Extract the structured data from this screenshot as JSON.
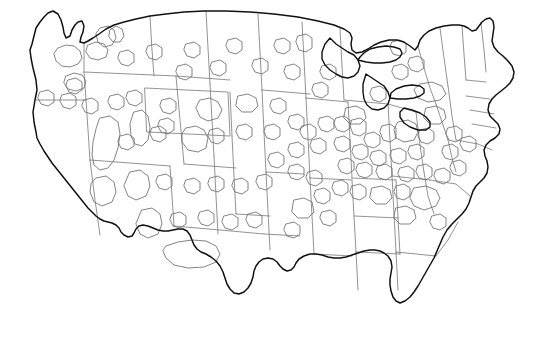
{
  "document": {
    "title": "Contiguous United States Outline Map",
    "type": "map",
    "caption": "",
    "background_color": "#ffffff",
    "width": 544,
    "height": 350
  },
  "map": {
    "name": "contiguous-united-states",
    "projection_hint": "albers-usa",
    "has_labels": false,
    "has_legend": false,
    "has_text": false,
    "colors": {
      "national_outline": "#111111",
      "state_border": "#777777",
      "region_overlay": "#6e6e6e",
      "lake_outline": "#111111",
      "land_fill": "#ffffff",
      "page_background": "#ffffff"
    },
    "line_weights": {
      "national_outline": 1.5,
      "state_border": 0.8,
      "region_overlay": 0.85,
      "lake_outline": 1.4
    },
    "layers": [
      {
        "id": "national-outline",
        "label": "National coastline and borders",
        "stroke": "#111111",
        "visible": true
      },
      {
        "id": "state-borders",
        "label": "State boundaries",
        "stroke": "#777777",
        "visible": true
      },
      {
        "id": "great-lakes",
        "label": "Great Lakes shoreline",
        "stroke": "#111111",
        "visible": true
      },
      {
        "id": "region-overlays",
        "label": "Region overlay polygons",
        "stroke": "#6e6e6e",
        "visible": true,
        "count": 96
      }
    ],
    "outline_path": "M 36 132 L 34 122 L 33 112 L 35 100 L 37 90 L 36 80 L 33 68 L 31 58 L 30 50 L 32 44 L 34 36 L 36 28 L 40 22 L 44 17 L 48 13 L 53 11 L 58 14 L 61 20 L 63 27 L 64 33 L 66 38 L 70 36 L 72 30 L 75 25 L 78 22 L 82 21 L 84 26 L 83 32 L 81 37 L 80 42 L 84 43 L 88 41 L 93 38 L 99 34 L 106 29 L 114 25 L 124 22 L 136 19 L 150 16 L 166 14 L 184 12 L 204 11 L 226 11 L 250 12 L 274 14 L 298 17 L 318 21 L 334 25 L 344 29 L 350 33 L 352 38 L 351 44 L 352 50 L 356 53 L 362 52 L 368 49 L 374 45 L 381 42 L 389 40 L 397 40 L 404 42 L 410 46 L 415 50 L 418 46 L 420 40 L 424 35 L 429 31 L 436 28 L 444 26 L 452 25 L 459 25 L 464 26 L 468 28 L 472 31 L 476 30 L 479 26 L 482 22 L 486 19 L 490 18 L 493 21 L 494 27 L 493 34 L 492 41 L 494 47 L 498 52 L 503 56 L 508 61 L 512 66 L 514 72 L 513 78 L 510 83 L 506 87 L 501 91 L 496 95 L 492 99 L 489 104 L 488 110 L 490 116 L 494 120 L 498 124 L 500 129 L 499 134 L 495 138 L 490 141 L 486 145 L 484 150 L 485 156 L 487 161 L 488 167 L 487 173 L 484 178 L 480 182 L 476 186 L 473 191 L 471 197 L 469 203 L 466 209 L 462 214 L 457 219 L 452 224 L 447 230 L 443 237 L 440 244 L 437 251 L 434 258 L 430 265 L 426 272 L 422 279 L 418 286 L 414 292 L 410 297 L 405 301 L 400 303 L 396 301 L 393 297 L 391 291 L 390 285 L 390 279 L 391 273 L 392 267 L 391 261 L 388 256 L 384 253 L 380 251 L 375 250 L 370 250 L 364 251 L 358 253 L 352 255 L 346 257 L 340 258 L 334 258 L 328 257 L 322 255 L 316 254 L 310 254 L 304 256 L 299 259 L 296 263 L 294 267 L 291 270 L 287 271 L 283 269 L 280 266 L 277 262 L 273 259 L 268 258 L 263 259 L 259 262 L 256 266 L 254 271 L 253 277 L 251 283 L 248 288 L 244 292 L 239 294 L 234 293 L 230 289 L 227 284 L 225 278 L 223 272 L 220 266 L 216 261 L 211 257 L 206 254 L 201 252 L 197 249 L 194 245 L 192 240 L 190 235 L 187 231 L 183 229 L 178 229 L 173 230 L 168 231 L 163 231 L 158 230 L 153 228 L 148 226 L 143 225 L 139 226 L 136 229 L 134 233 L 132 236 L 128 237 L 124 235 L 121 232 L 119 228 L 116 225 L 112 223 L 108 222 L 104 221 L 100 219 L 96 216 L 92 212 L 88 208 L 84 203 L 80 198 L 76 193 L 72 188 L 68 183 L 64 178 L 60 173 L 56 168 L 52 163 L 48 157 L 44 151 L 40 144 L 37 138 Z",
    "state_border_paths": [
      "M 84 43 L 84 72 L 86 100",
      "M 36 100 L 70 100 L 86 100",
      "M 86 100 L 88 130 L 90 160",
      "M 90 160 L 130 163 L 170 166",
      "M 170 166 L 172 196 L 174 226",
      "M 90 160 L 95 200 L 100 235",
      "M 84 72 L 130 74 L 176 76",
      "M 176 76 L 180 120 L 184 164",
      "M 150 16 L 152 50 L 154 76",
      "M 206 11 L 208 48 L 210 84",
      "M 210 84 L 212 120 L 214 156",
      "M 214 156 L 216 196 L 218 234",
      "M 145 88 L 228 92 L 230 136 L 147 132 Z",
      "M 230 92 L 232 136",
      "M 232 136 L 234 176 L 236 214",
      "M 176 76 L 230 80",
      "M 184 164 L 236 168",
      "M 174 226 L 220 230 L 264 234",
      "M 258 14 L 260 52 L 262 90",
      "M 262 90 L 264 132 L 266 172",
      "M 266 172 L 268 212 L 270 250",
      "M 236 214 L 270 216",
      "M 262 90 L 310 94",
      "M 266 172 L 304 174",
      "M 264 234 L 300 236",
      "M 302 22 L 304 60 L 306 98",
      "M 306 98 L 308 138 L 310 178",
      "M 310 178 L 312 216 L 314 254",
      "M 306 98 L 348 102",
      "M 310 178 L 352 180",
      "M 314 254 L 352 256",
      "M 340 29 L 342 66 L 344 100",
      "M 348 102 L 350 140 L 352 178",
      "M 352 180 L 354 216 L 356 252",
      "M 356 252 L 358 290",
      "M 352 178 L 396 180",
      "M 354 216 L 398 218",
      "M 356 252 L 400 254",
      "M 344 100 L 388 104 L 416 112",
      "M 388 104 L 390 140 L 392 176",
      "M 392 176 L 394 214 L 396 252",
      "M 396 252 L 398 290",
      "M 416 112 L 420 145 L 424 172",
      "M 424 172 L 428 196 L 434 214",
      "M 392 176 L 430 180",
      "M 396 252 L 436 256",
      "M 396 180 L 398 218 L 400 254",
      "M 418 46 L 424 68 L 430 88 L 436 104",
      "M 436 104 L 442 122 L 448 140",
      "M 448 140 L 452 158 L 456 172",
      "M 430 180 L 456 184 L 470 196",
      "M 436 256 L 448 240 L 458 222",
      "M 440 28 L 444 58 L 448 86",
      "M 448 86 L 452 116 L 456 140",
      "M 462 26 L 464 54 L 466 80",
      "M 481 23 L 484 50 L 486 72",
      "M 466 80 L 486 82",
      "M 466 96 L 490 99",
      "M 470 110 L 494 114",
      "M 456 140 L 478 144 L 492 150",
      "M 472 124 L 496 128"
    ],
    "great_lakes_paths": [
      "M 330 38 L 336 44 L 342 48 L 348 52 L 354 55 L 358 60 L 360 66 L 358 72 L 354 76 L 348 78 L 342 77 L 336 74 L 330 70 L 325 65 L 322 59 L 322 52 L 325 44 Z",
      "M 358 60 L 366 62 L 374 63 L 382 63 L 390 62 L 396 60 L 400 57 L 402 53 L 400 49 L 394 47 L 386 46 L 378 47 L 370 49 L 364 53 L 360 57 Z",
      "M 366 74 L 372 78 L 378 82 L 384 86 L 388 92 L 390 98 L 388 104 L 384 108 L 378 110 L 372 109 L 367 105 L 364 99 L 363 92 L 363 84 Z",
      "M 390 98 L 398 99 L 406 99 L 414 98 L 420 96 L 424 93 L 424 89 L 420 86 L 412 85 L 404 86 L 396 89 L 391 93 Z",
      "M 404 108 L 412 110 L 420 113 L 426 117 L 430 122 L 430 127 L 426 130 L 418 130 L 410 127 L 404 123 L 400 117 L 400 112 Z"
    ],
    "region_overlay_paths": [
      "M 58 48 L 66 45 L 74 46 L 80 51 L 82 58 L 78 64 L 70 67 L 62 66 L 56 61 L 54 54 Z",
      "M 88 45 L 96 42 L 104 44 L 108 50 L 106 57 L 98 60 L 90 58 L 86 52 Z",
      "M 100 28 L 108 26 L 114 30 L 116 38 L 112 45 L 104 47 L 98 42 L 96 34 Z",
      "M 66 76 L 74 73 L 82 75 L 86 81 L 84 88 L 76 91 L 68 89 L 64 83 Z",
      "M 110 30 L 116 26 L 122 29 L 124 36 L 120 42 L 113 42 L 109 37 Z",
      "M 120 52 L 128 50 L 134 54 L 134 62 L 128 66 L 121 64 L 118 58 Z",
      "M 148 46 L 156 44 L 162 48 L 162 56 L 156 60 L 149 58 L 146 52 Z",
      "M 186 44 L 194 42 L 200 46 L 200 54 L 194 58 L 187 56 L 184 50 Z",
      "M 228 40 L 236 38 L 242 42 L 242 50 L 236 54 L 229 52 L 226 46 Z",
      "M 276 40 L 284 38 L 290 42 L 290 50 L 284 54 L 277 52 L 274 46 Z",
      "M 298 36 L 306 34 L 312 38 L 312 48 L 306 52 L 299 50 L 296 42 Z",
      "M 178 66 L 186 64 L 192 68 L 192 76 L 186 80 L 179 78 L 176 72 Z",
      "M 212 62 L 220 60 L 226 64 L 226 72 L 220 76 L 213 74 L 210 68 Z",
      "M 254 60 L 262 58 L 268 62 L 268 70 L 262 74 L 255 72 L 252 66 Z",
      "M 162 100 L 170 98 L 176 102 L 176 110 L 170 114 L 163 112 L 160 106 Z",
      "M 160 120 L 168 118 L 174 122 L 174 130 L 168 134 L 161 132 L 158 126 Z",
      "M 68 80 L 76 78 L 82 82 L 82 90 L 76 94 L 69 92 L 66 86 Z",
      "M 62 95 L 70 93 L 76 97 L 76 105 L 70 109 L 63 107 L 60 101 Z",
      "M 40 92 L 48 90 L 54 94 L 54 102 L 48 106 L 41 104 L 38 98 Z",
      "M 84 100 L 92 98 L 98 102 L 98 110 L 92 114 L 85 112 L 82 106 Z",
      "M 110 96 L 118 94 L 124 98 L 124 106 L 118 110 L 111 108 L 108 102 Z",
      "M 128 92 L 136 90 L 142 94 L 142 102 L 136 106 L 129 104 L 126 98 Z",
      "M 200 100 L 210 98 L 218 102 L 222 110 L 218 118 L 208 121 L 200 117 L 196 108 Z",
      "M 238 96 L 248 94 L 256 98 L 258 106 L 252 112 L 242 112 L 236 106 Z",
      "M 272 100 L 280 98 L 286 102 L 286 110 L 280 114 L 273 112 L 270 106 Z",
      "M 100 118 L 110 116 L 118 122 L 120 134 L 118 148 L 114 160 L 108 168 L 100 170 L 94 165 L 92 155 L 93 142 L 96 129 Z",
      "M 134 112 L 142 110 L 148 116 L 150 128 L 148 140 L 142 146 L 135 144 L 131 136 L 130 124 Z",
      "M 120 136 L 128 134 L 134 138 L 134 146 L 128 150 L 121 148 L 118 142 Z",
      "M 152 128 L 160 126 L 166 130 L 166 138 L 160 142 L 153 140 L 150 134 Z",
      "M 186 128 L 196 126 L 204 130 L 208 138 L 206 148 L 198 152 L 188 150 L 182 142 L 182 134 Z",
      "M 210 130 L 218 128 L 224 132 L 224 140 L 218 144 L 211 142 L 208 136 Z",
      "M 238 126 L 246 124 L 252 128 L 252 136 L 246 140 L 239 138 L 236 132 Z",
      "M 266 126 L 274 124 L 280 128 L 280 136 L 274 140 L 267 138 L 264 132 Z",
      "M 96 178 L 106 176 L 114 182 L 116 192 L 112 202 L 102 206 L 94 202 L 90 192 L 91 184 Z",
      "M 130 172 L 140 170 L 148 176 L 150 186 L 146 196 L 136 200 L 128 196 L 124 186 Z",
      "M 158 176 L 166 174 L 172 178 L 172 186 L 166 190 L 159 188 L 156 182 Z",
      "M 186 180 L 194 178 L 200 182 L 200 190 L 194 194 L 187 192 L 184 186 Z",
      "M 210 178 L 218 176 L 224 180 L 224 188 L 218 192 L 211 190 L 208 184 Z",
      "M 234 180 L 242 178 L 248 182 L 248 190 L 242 194 L 235 192 L 232 186 Z",
      "M 258 176 L 266 174 L 272 178 L 272 186 L 266 190 L 259 188 L 256 182 Z",
      "M 142 210 L 152 208 L 160 214 L 162 224 L 158 234 L 148 238 L 140 234 L 136 224 Z",
      "M 172 214 L 180 212 L 186 216 L 186 224 L 180 228 L 173 226 L 170 220 Z",
      "M 200 212 L 208 210 L 214 214 L 214 222 L 208 226 L 201 224 L 198 218 Z",
      "M 224 216 L 232 214 L 238 218 L 238 226 L 232 230 L 225 228 L 222 222 Z",
      "M 248 214 L 256 212 L 262 216 L 262 224 L 256 228 L 249 226 L 246 220 Z",
      "M 166 246 L 178 242 L 192 240 L 206 241 L 216 246 L 220 254 L 216 262 L 204 267 L 188 268 L 174 265 L 166 258 L 163 251 Z",
      "M 290 144 L 298 142 L 304 146 L 304 154 L 298 158 L 291 156 L 288 150 Z",
      "M 312 140 L 320 138 L 326 142 L 326 150 L 320 154 L 313 152 L 310 146 Z",
      "M 336 138 L 344 136 L 350 140 L 350 148 L 344 152 L 337 150 L 334 144 Z",
      "M 352 120 L 360 118 L 366 122 L 366 132 L 360 136 L 353 134 L 350 126 Z",
      "M 366 134 L 374 132 L 380 136 L 380 144 L 374 148 L 367 146 L 364 140 Z",
      "M 382 126 L 390 124 L 396 128 L 396 138 L 390 142 L 383 140 L 380 132 Z",
      "M 398 122 L 408 120 L 416 124 L 418 132 L 414 140 L 404 142 L 396 138 L 394 130 Z",
      "M 354 146 L 362 144 L 368 148 L 368 156 L 362 160 L 355 158 L 352 152 Z",
      "M 372 152 L 380 150 L 386 154 L 386 162 L 380 166 L 373 164 L 370 158 Z",
      "M 392 150 L 400 148 L 406 152 L 406 160 L 400 164 L 393 162 L 390 156 Z",
      "M 410 146 L 418 144 L 424 148 L 424 156 L 418 160 L 411 158 L 408 152 Z",
      "M 340 160 L 348 158 L 354 162 L 354 170 L 348 174 L 341 172 L 338 166 Z",
      "M 358 164 L 366 162 L 372 166 L 372 174 L 366 178 L 359 176 L 356 170 Z",
      "M 378 166 L 386 164 L 392 168 L 392 176 L 386 180 L 379 178 L 376 172 Z",
      "M 400 168 L 408 166 L 414 170 L 414 178 L 408 182 L 401 180 L 398 174 Z",
      "M 418 166 L 426 164 L 432 168 L 432 176 L 426 180 L 419 178 L 416 172 Z",
      "M 334 182 L 342 180 L 348 184 L 348 192 L 342 196 L 335 194 L 332 188 Z",
      "M 352 186 L 360 184 L 366 188 L 366 196 L 360 200 L 353 198 L 350 192 Z",
      "M 372 188 L 382 186 L 390 190 L 392 198 L 386 204 L 376 204 L 370 198 Z",
      "M 396 186 L 404 184 L 410 188 L 410 196 L 404 200 L 397 198 L 394 192 Z",
      "M 414 188 L 426 186 L 436 190 L 440 198 L 436 206 L 424 210 L 414 206 L 410 198 Z",
      "M 316 190 L 324 188 L 330 192 L 330 200 L 324 204 L 317 202 L 314 196 Z",
      "M 308 172 L 316 170 L 322 174 L 322 182 L 316 186 L 309 184 L 306 178 Z",
      "M 290 166 L 298 164 L 304 168 L 304 176 L 298 180 L 291 178 L 288 172 Z",
      "M 270 154 L 278 152 L 284 156 L 284 164 L 278 168 L 271 166 L 268 160 Z",
      "M 294 200 L 304 198 L 312 202 L 314 212 L 308 218 L 298 218 L 292 212 Z",
      "M 322 212 L 330 210 L 336 214 L 336 222 L 330 226 L 323 224 L 320 218 Z",
      "M 286 224 L 294 222 L 300 226 L 300 234 L 294 238 L 287 236 L 284 230 Z",
      "M 396 208 L 406 206 L 414 210 L 416 218 L 410 224 L 400 224 L 394 218 Z",
      "M 432 216 L 440 214 L 446 218 L 446 226 L 440 230 L 433 228 L 430 222 Z",
      "M 346 108 L 356 106 L 364 110 L 366 118 L 360 124 L 350 124 L 344 118 Z",
      "M 336 118 L 344 116 L 350 120 L 350 128 L 344 132 L 337 130 L 334 124 Z",
      "M 320 118 L 328 116 L 334 120 L 334 128 L 328 132 L 321 130 L 318 124 Z",
      "M 302 126 L 310 124 L 316 128 L 316 136 L 310 140 L 303 138 L 300 132 Z",
      "M 290 116 L 298 114 L 304 118 L 304 126 L 298 130 L 291 128 L 288 122 Z",
      "M 420 130 L 428 128 L 434 132 L 434 140 L 428 144 L 421 142 L 418 136 Z",
      "M 426 108 L 436 106 L 444 110 L 446 118 L 440 124 L 430 124 L 424 118 Z",
      "M 448 128 L 456 126 L 462 130 L 462 138 L 456 142 L 449 140 L 446 134 Z",
      "M 444 146 L 452 144 L 458 148 L 458 156 L 452 160 L 445 158 L 442 152 Z",
      "M 452 162 L 460 160 L 466 164 L 466 172 L 460 176 L 453 174 L 450 168 Z",
      "M 462 138 L 470 136 L 476 140 L 476 148 L 470 152 L 463 150 L 460 144 Z",
      "M 436 170 L 444 168 L 450 172 L 450 180 L 444 184 L 437 182 L 434 176 Z",
      "M 392 42 L 400 40 L 406 44 L 406 52 L 400 56 L 393 54 L 390 48 Z",
      "M 420 84 L 432 82 L 442 86 L 446 94 L 440 100 L 428 102 L 418 98 L 414 90 Z",
      "M 394 66 L 402 64 L 408 68 L 408 76 L 402 80 L 395 78 L 392 72 Z",
      "M 372 88 L 380 86 L 386 90 L 386 98 L 380 102 L 373 100 L 370 94 Z",
      "M 410 58 L 418 56 L 424 60 L 424 68 L 418 72 L 411 70 L 408 64 Z",
      "M 286 66 L 294 64 L 300 68 L 300 76 L 294 80 L 287 78 L 284 72 Z",
      "M 322 66 L 330 64 L 336 68 L 336 76 L 330 80 L 323 78 L 320 72 Z",
      "M 314 84 L 322 82 L 328 86 L 328 94 L 322 98 L 315 96 L 312 90 Z"
    ]
  }
}
